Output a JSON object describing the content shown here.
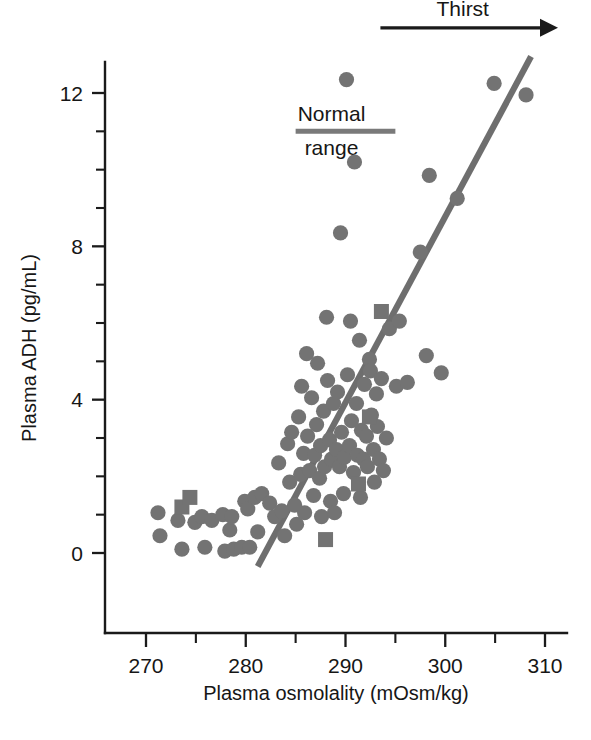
{
  "chart_data": {
    "type": "scatter",
    "title": "",
    "xlabel": "Plasma osmolality (mOsm/kg)",
    "ylabel": "Plasma ADH (pg/mL)",
    "xlim": [
      266,
      312
    ],
    "ylim": [
      -1.6,
      13.2
    ],
    "x_ticks_major": [
      270,
      280,
      290,
      300,
      310
    ],
    "x_ticks_minor": [
      275,
      285,
      295,
      305
    ],
    "y_ticks_major": [
      0,
      4,
      8,
      12
    ],
    "y_ticks_minor": [
      1,
      2,
      3,
      5,
      6,
      7,
      9,
      10,
      11
    ],
    "grid": false,
    "legend": "none",
    "annotations": [
      {
        "name": "thirst-arrow",
        "text": "Thirst",
        "x_start": 293.5,
        "x_end": 310.0,
        "y": 13.7
      },
      {
        "name": "normal-range",
        "text_line1": "Normal",
        "text_line2": "range",
        "x_start": 285.0,
        "x_end": 295.0,
        "y": 11.0
      }
    ],
    "trend_line": {
      "name": "regression-line",
      "x_start": 281.2,
      "y_start": -0.35,
      "x_end": 308.6,
      "y_end": 12.95,
      "color": "#6e6e6e"
    },
    "marker_colors": {
      "circle": "#737373",
      "square": "#737373"
    },
    "series": [
      {
        "name": "circles",
        "marker": "circle",
        "points": [
          [
            271.2,
            1.05
          ],
          [
            271.4,
            0.45
          ],
          [
            273.2,
            0.85
          ],
          [
            273.6,
            0.1
          ],
          [
            274.9,
            0.8
          ],
          [
            275.6,
            0.95
          ],
          [
            275.9,
            0.15
          ],
          [
            276.6,
            0.85
          ],
          [
            277.7,
            1.0
          ],
          [
            277.9,
            0.05
          ],
          [
            278.4,
            0.6
          ],
          [
            278.6,
            0.95
          ],
          [
            278.8,
            0.1
          ],
          [
            279.6,
            0.15
          ],
          [
            279.9,
            1.35
          ],
          [
            280.2,
            1.15
          ],
          [
            280.4,
            0.15
          ],
          [
            280.9,
            1.45
          ],
          [
            281.2,
            0.55
          ],
          [
            281.6,
            1.55
          ],
          [
            282.4,
            1.3
          ],
          [
            282.9,
            0.95
          ],
          [
            283.3,
            2.35
          ],
          [
            283.6,
            1.1
          ],
          [
            283.9,
            0.45
          ],
          [
            284.2,
            2.85
          ],
          [
            284.4,
            1.85
          ],
          [
            284.6,
            3.15
          ],
          [
            284.9,
            1.25
          ],
          [
            285.1,
            0.75
          ],
          [
            285.3,
            3.55
          ],
          [
            285.5,
            2.05
          ],
          [
            285.6,
            4.35
          ],
          [
            285.8,
            2.6
          ],
          [
            285.9,
            1.05
          ],
          [
            286.1,
            5.2
          ],
          [
            286.2,
            3.05
          ],
          [
            286.4,
            2.15
          ],
          [
            286.6,
            4.05
          ],
          [
            286.8,
            1.5
          ],
          [
            286.9,
            2.55
          ],
          [
            287.1,
            3.35
          ],
          [
            287.2,
            4.95
          ],
          [
            287.4,
            1.95
          ],
          [
            287.5,
            2.8
          ],
          [
            287.6,
            0.95
          ],
          [
            287.8,
            3.7
          ],
          [
            287.9,
            2.25
          ],
          [
            288.1,
            6.15
          ],
          [
            288.2,
            4.5
          ],
          [
            288.4,
            2.95
          ],
          [
            288.5,
            1.35
          ],
          [
            288.6,
            2.45
          ],
          [
            288.8,
            3.9
          ],
          [
            288.9,
            1.05
          ],
          [
            289.1,
            2.7
          ],
          [
            289.2,
            4.2
          ],
          [
            289.4,
            2.25
          ],
          [
            289.5,
            8.35
          ],
          [
            289.6,
            3.15
          ],
          [
            289.8,
            1.55
          ],
          [
            289.9,
            2.5
          ],
          [
            290.1,
            12.35
          ],
          [
            290.2,
            4.65
          ],
          [
            290.4,
            2.8
          ],
          [
            290.5,
            6.05
          ],
          [
            290.6,
            3.45
          ],
          [
            290.8,
            2.1
          ],
          [
            290.9,
            10.2
          ],
          [
            291.1,
            3.9
          ],
          [
            291.2,
            2.55
          ],
          [
            291.4,
            5.55
          ],
          [
            291.5,
            1.45
          ],
          [
            291.6,
            3.2
          ],
          [
            291.8,
            2.45
          ],
          [
            291.9,
            4.4
          ],
          [
            292.1,
            3.05
          ],
          [
            292.2,
            2.25
          ],
          [
            292.4,
            5.05
          ],
          [
            292.5,
            4.75
          ],
          [
            292.6,
            3.6
          ],
          [
            292.8,
            2.7
          ],
          [
            292.9,
            1.85
          ],
          [
            293.1,
            4.15
          ],
          [
            293.2,
            3.3
          ],
          [
            293.4,
            2.45
          ],
          [
            293.6,
            4.55
          ],
          [
            293.8,
            2.15
          ],
          [
            294.1,
            3.0
          ],
          [
            294.4,
            5.85
          ],
          [
            295.1,
            4.35
          ],
          [
            295.4,
            6.05
          ],
          [
            296.2,
            4.45
          ],
          [
            297.5,
            7.85
          ],
          [
            298.1,
            5.15
          ],
          [
            298.4,
            9.85
          ],
          [
            299.6,
            4.7
          ],
          [
            301.2,
            9.25
          ],
          [
            304.9,
            12.25
          ],
          [
            308.1,
            11.95
          ]
        ]
      },
      {
        "name": "squares",
        "marker": "square",
        "points": [
          [
            273.6,
            1.2
          ],
          [
            274.4,
            1.45
          ],
          [
            288.0,
            0.35
          ],
          [
            291.3,
            1.8
          ],
          [
            292.4,
            3.55
          ],
          [
            293.6,
            6.3
          ]
        ]
      }
    ]
  },
  "axis": {
    "x_tick_labels": [
      "270",
      "280",
      "290",
      "300",
      "310"
    ],
    "y_tick_labels": [
      "0",
      "4",
      "8",
      "12"
    ]
  }
}
